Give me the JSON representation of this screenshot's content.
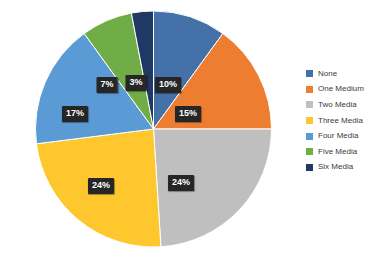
{
  "chart_data": {
    "type": "pie",
    "title": "",
    "categories": [
      "None",
      "One Medium",
      "Two Media",
      "Three Media",
      "Four Media",
      "Five Media",
      "Six Media"
    ],
    "values": [
      10,
      15,
      24,
      24,
      17,
      7,
      3
    ],
    "value_unit": "%",
    "data_labels": [
      "10%",
      "15%",
      "24%",
      "24%",
      "17%",
      "7%",
      "3%"
    ],
    "colors": [
      "#4472A8",
      "#ED7D31",
      "#BFBFBF",
      "#FFC72E",
      "#5B9BD5",
      "#70AD47",
      "#1F3864"
    ],
    "legend_position": "right",
    "grid": false,
    "start_angle_deg": 0,
    "direction": "clockwise"
  },
  "legend": {
    "items": [
      {
        "label": "None",
        "color": "#4472A8"
      },
      {
        "label": "One Medium",
        "color": "#ED7D31"
      },
      {
        "label": "Two Media",
        "color": "#BFBFBF"
      },
      {
        "label": "Three Media",
        "color": "#FFC72E"
      },
      {
        "label": "Four Media",
        "color": "#5B9BD5"
      },
      {
        "label": "Five Media",
        "color": "#70AD47"
      },
      {
        "label": "Six Media",
        "color": "#1F3864"
      }
    ]
  },
  "labels": {
    "none": "10%",
    "one_medium": "15%",
    "two_media": "24%",
    "three_media": "24%",
    "four_media": "17%",
    "five_media": "7%",
    "six_media": "3%"
  },
  "background": "#ffffff"
}
